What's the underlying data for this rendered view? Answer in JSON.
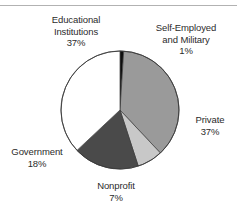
{
  "figure": {
    "name": "pie-chart-figure",
    "has_top_rule": true,
    "background": "#ffffff"
  },
  "chart_data": {
    "type": "pie",
    "title": "",
    "subtitle": "",
    "xlabel": "",
    "ylabel": "",
    "grid": false,
    "legend_position": "callout-labels",
    "total": 100,
    "units": "percent",
    "start_angle_deg": 0,
    "direction": "clockwise",
    "categories": [
      "Self-Employed and Military",
      "Private",
      "Nonprofit",
      "Government",
      "Educational Institutions"
    ],
    "values": [
      1,
      37,
      7,
      18,
      37
    ],
    "colors": [
      "#0d0d0d",
      "#9a9a9a",
      "#c8c8c8",
      "#4a4a4a",
      "#ffffff"
    ],
    "slices": [
      {
        "label": "Self-Employed and Military",
        "label_line_1": "Self-Employed",
        "label_line_2": "and Military",
        "value": 1,
        "value_text": "1%",
        "color": "#0d0d0d"
      },
      {
        "label": "Private",
        "label_line_1": "Private",
        "label_line_2": "",
        "value": 37,
        "value_text": "37%",
        "color": "#9a9a9a"
      },
      {
        "label": "Nonprofit",
        "label_line_1": "Nonprofit",
        "label_line_2": "",
        "value": 7,
        "value_text": "7%",
        "color": "#c8c8c8"
      },
      {
        "label": "Government",
        "label_line_1": "Government",
        "label_line_2": "",
        "value": 18,
        "value_text": "18%",
        "color": "#4a4a4a"
      },
      {
        "label": "Educational Institutions",
        "label_line_1": "Educational",
        "label_line_2": "Institutions",
        "value": 37,
        "value_text": "37%",
        "color": "#ffffff"
      }
    ]
  },
  "labels": {
    "educational": {
      "line1": "Educational",
      "line2": "Institutions",
      "value": "37%"
    },
    "self_employed": {
      "line1": "Self-Employed",
      "line2": "and Military",
      "value": "1%"
    },
    "private": {
      "line1": "Private",
      "value": "37%"
    },
    "government": {
      "line1": "Government",
      "value": "18%"
    },
    "nonprofit": {
      "line1": "Nonprofit",
      "value": "7%"
    }
  }
}
